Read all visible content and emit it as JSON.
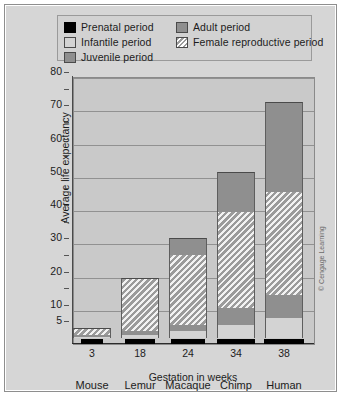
{
  "legend": {
    "items": [
      {
        "key": "prenatal",
        "label": "Prenatal period",
        "color": "#000000"
      },
      {
        "key": "infantile",
        "label": "Infantile period",
        "color": "#d3d3d3"
      },
      {
        "key": "juvenile",
        "label": "Juvenile period",
        "color": "#8f8f8f"
      },
      {
        "key": "adult",
        "label": "Adult period",
        "color": "#8f8f8f"
      },
      {
        "key": "repro",
        "label": "Female reproductive period",
        "color": "#c9c9c9"
      }
    ]
  },
  "axes": {
    "ylabel_line1": "Average life expectancy",
    "ylabel_line2": "in years",
    "xlabel": "Gestation in weeks",
    "yticks": [
      "5",
      "10",
      "20",
      "30",
      "40",
      "50",
      "60",
      "70",
      "80"
    ]
  },
  "credit": "© Cengage Learning",
  "chart_data": {
    "type": "bar",
    "title": "",
    "subtitle": "",
    "xlabel": "Gestation in weeks",
    "ylabel": "Average life expectancy in years",
    "ylim": [
      0,
      80
    ],
    "yticks": [
      5,
      10,
      20,
      30,
      40,
      50,
      60,
      70,
      80
    ],
    "gridlines_at": [
      10,
      20,
      30,
      40,
      50,
      60,
      70,
      80
    ],
    "grid": true,
    "legend_position": "top",
    "stacked": true,
    "categories": [
      "Mouse",
      "Lemur",
      "Macaque",
      "Chimp",
      "Human"
    ],
    "gestation_weeks": [
      3,
      18,
      24,
      34,
      38
    ],
    "gestation_labels": [
      "3",
      "18",
      "24",
      "34",
      "38"
    ],
    "series": [
      {
        "name": "Infantile period",
        "values": [
          0.4,
          0.8,
          2,
          4,
          6
        ]
      },
      {
        "name": "Juvenile period",
        "values": [
          0.4,
          1.2,
          2,
          5,
          7
        ]
      },
      {
        "name": "Female reproductive period",
        "values": [
          2.2,
          16,
          21,
          29,
          31
        ]
      },
      {
        "name": "Adult period",
        "values": [
          0,
          0,
          5,
          12,
          27
        ]
      }
    ],
    "totals": [
      3,
      18,
      30,
      50,
      71
    ],
    "prenatal_note": "Prenatal period drawn as a black bar below the zero baseline, width proportional to gestation weeks",
    "annotations": []
  },
  "bars": [
    {
      "species": "Mouse",
      "gestation": "3",
      "total": 3,
      "segments": [
        {
          "type": "infantile",
          "from": 0,
          "to": 0.4
        },
        {
          "type": "juvenile",
          "from": 0.4,
          "to": 0.8
        },
        {
          "type": "repro",
          "from": 0.8,
          "to": 3
        }
      ],
      "prenatal_width": 22
    },
    {
      "species": "Lemur",
      "gestation": "18",
      "total": 18,
      "segments": [
        {
          "type": "infantile",
          "from": 0,
          "to": 0.8
        },
        {
          "type": "juvenile",
          "from": 0.8,
          "to": 2
        },
        {
          "type": "repro",
          "from": 2,
          "to": 18
        }
      ],
      "prenatal_width": 30
    },
    {
      "species": "Macaque",
      "gestation": "24",
      "total": 30,
      "segments": [
        {
          "type": "infantile",
          "from": 0,
          "to": 2
        },
        {
          "type": "juvenile",
          "from": 2,
          "to": 4
        },
        {
          "type": "repro",
          "from": 4,
          "to": 25
        },
        {
          "type": "adult",
          "from": 25,
          "to": 30
        }
      ],
      "prenatal_width": 34
    },
    {
      "species": "Chimp",
      "gestation": "34",
      "total": 50,
      "segments": [
        {
          "type": "infantile",
          "from": 0,
          "to": 4
        },
        {
          "type": "juvenile",
          "from": 4,
          "to": 9
        },
        {
          "type": "repro",
          "from": 9,
          "to": 38
        },
        {
          "type": "adult",
          "from": 38,
          "to": 50
        }
      ],
      "prenatal_width": 38
    },
    {
      "species": "Human",
      "gestation": "38",
      "total": 71,
      "segments": [
        {
          "type": "infantile",
          "from": 0,
          "to": 6
        },
        {
          "type": "juvenile",
          "from": 6,
          "to": 13
        },
        {
          "type": "repro",
          "from": 13,
          "to": 44
        },
        {
          "type": "adult",
          "from": 44,
          "to": 71
        }
      ],
      "prenatal_width": 40
    }
  ]
}
